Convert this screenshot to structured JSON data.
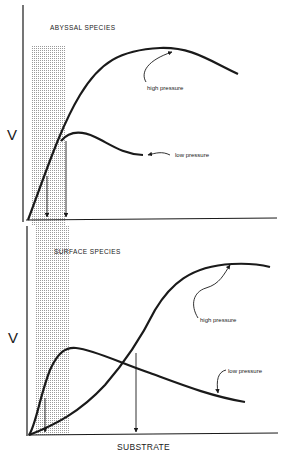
{
  "panels": [
    {
      "title": "ABYSSAL SPECIES",
      "y_label": "V",
      "curves": [
        {
          "name": "high pressure",
          "label": "high pressure"
        },
        {
          "name": "low pressure",
          "label": "low pressure"
        }
      ]
    },
    {
      "title": "SURFACE SPECIES",
      "y_label": "V",
      "curves": [
        {
          "name": "high pressure",
          "label": "high pressure"
        },
        {
          "name": "low pressure",
          "label": "low pressure"
        }
      ]
    }
  ],
  "x_label": "SUBSTRATE",
  "colors": {
    "ink": "#1a1a1a",
    "shade": "#bdbdbd"
  }
}
